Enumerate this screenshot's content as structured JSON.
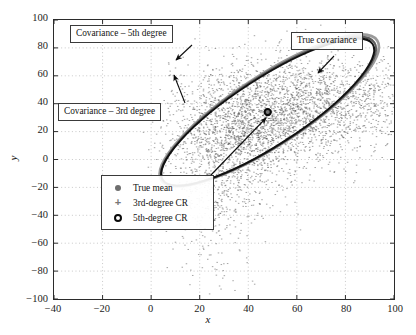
{
  "chart_data": {
    "type": "scatter",
    "title": "",
    "xlabel": "x",
    "ylabel": "y",
    "xlim": [
      -40,
      100
    ],
    "ylim": [
      -100,
      100
    ],
    "xticks": [
      -40,
      -20,
      0,
      20,
      40,
      60,
      80,
      100
    ],
    "yticks": [
      -100,
      -80,
      -60,
      -40,
      -20,
      0,
      20,
      40,
      60,
      80,
      100
    ],
    "xtick_labels": [
      "−40",
      "−20",
      "0",
      "20",
      "40",
      "60",
      "80",
      "100"
    ],
    "ytick_labels": [
      "−100",
      "−80",
      "−60",
      "−40",
      "−20",
      "0",
      "20",
      "40",
      "60",
      "80",
      "100"
    ],
    "grid": true,
    "grid_style": "dotted",
    "series": [
      {
        "name": "Monte Carlo samples",
        "type": "scatter",
        "marker": "dot",
        "color": "#555555",
        "n_points": 4000,
        "distribution": "banana-shaped cloud concentrated inside the covariance ellipse with a long tail toward the lower-right",
        "cloud_center": [
          46,
          34
        ],
        "cloud_spread": [
          31,
          18
        ],
        "cloud_rotation_deg": 33
      },
      {
        "name": "True mean",
        "type": "marker",
        "marker": "filled-circle",
        "color": "#6e6e6e",
        "point": [
          48,
          34
        ]
      },
      {
        "name": "3rd-degree CR",
        "type": "marker",
        "marker": "plus",
        "color": "#777777",
        "point": [
          48,
          34
        ]
      },
      {
        "name": "5th-degree CR",
        "type": "marker",
        "marker": "open-circle-bold",
        "color": "#0a0a0a",
        "point": [
          48,
          34
        ]
      }
    ],
    "ellipses": [
      {
        "name": "True covariance",
        "center": [
          48,
          34
        ],
        "semi_major": 53,
        "semi_minor": 25,
        "rotation_deg": 33,
        "color": "#9a9a9a",
        "linewidth": 2.6,
        "offset": [
          1.6,
          1.6
        ]
      },
      {
        "name": "Covariance - 5th degree",
        "center": [
          48,
          34
        ],
        "semi_major": 52,
        "semi_minor": 24.5,
        "rotation_deg": 33,
        "color": "#5d5d5d",
        "linewidth": 2.1,
        "offset": [
          0.8,
          0.8
        ]
      },
      {
        "name": "Covariance - 3rd degree",
        "center": [
          48,
          34
        ],
        "semi_major": 51.5,
        "semi_minor": 24,
        "rotation_deg": 33,
        "color": "#111111",
        "linewidth": 1.9,
        "offset": [
          0,
          0
        ]
      }
    ],
    "annotations": [
      {
        "id": "cov-5th",
        "text": "Covariance – 5th degree",
        "box_xy": [
          70,
          25
        ],
        "arrow_from": [
          192,
          45
        ],
        "arrow_to": [
          176,
          60
        ]
      },
      {
        "id": "cov-3rd",
        "text": "Covariance – 3rd degree",
        "box_xy": [
          58,
          103
        ],
        "arrow_from": [
          185,
          103
        ],
        "arrow_to": [
          174,
          75
        ]
      },
      {
        "id": "true-cov",
        "text": "True covariance",
        "box_xy": [
          291,
          32
        ],
        "arrow_from": [
          334,
          56
        ],
        "arrow_to": [
          318,
          73
        ]
      },
      {
        "id": "true-mean",
        "text": "",
        "arrow_from": [
          210,
          176
        ],
        "arrow_to": [
          266,
          118
        ]
      }
    ],
    "legend": {
      "position": "inside-lower-left-center",
      "entries": [
        {
          "marker": "filled-circle",
          "label": "True mean"
        },
        {
          "marker": "plus",
          "label": "3rd-degree CR"
        },
        {
          "marker": "open-circle-bold",
          "label": "5th-degree CR"
        }
      ]
    },
    "colors": {
      "axis": "#2b2b2b",
      "grid": "#b9b9b9",
      "scatter": "#555555",
      "true_covariance": "#9a9a9a",
      "fifth_degree": "#5d5d5d",
      "third_degree": "#111111",
      "annotation_border": "#3a3a3a",
      "background": "#ffffff"
    }
  }
}
